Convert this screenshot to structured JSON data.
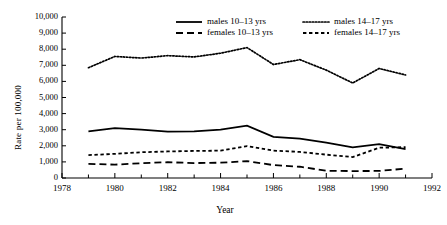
{
  "chart_data": {
    "type": "line",
    "title": "",
    "xlabel": "Year",
    "ylabel": "Rate per 100,000",
    "xlim": [
      1978,
      1992
    ],
    "ylim": [
      0,
      10000
    ],
    "grid": false,
    "legend_position": "top-inside",
    "x": [
      1979,
      1980,
      1981,
      1982,
      1983,
      1984,
      1985,
      1986,
      1987,
      1988,
      1989,
      1990,
      1991
    ],
    "xticks": [
      1978,
      1980,
      1982,
      1984,
      1986,
      1988,
      1990,
      1992
    ],
    "xtick_labels": [
      "1978",
      "1980",
      "1982",
      "1984",
      "1986",
      "1988",
      "1990",
      "1992"
    ],
    "xminor_ticks": [
      1979,
      1981,
      1983,
      1985,
      1987,
      1989,
      1991
    ],
    "yticks": [
      0,
      1000,
      2000,
      3000,
      4000,
      5000,
      6000,
      7000,
      8000,
      9000,
      10000
    ],
    "ytick_labels": [
      "0",
      "1,000",
      "2,000",
      "3,000",
      "4,000",
      "5,000",
      "6,000",
      "7,000",
      "8,000",
      "9,000",
      "10,000"
    ],
    "series": [
      {
        "name": "males 10–13 yrs",
        "style": "solid",
        "values": [
          2900,
          3100,
          3000,
          2880,
          2900,
          3000,
          3250,
          2550,
          2450,
          2200,
          1900,
          2100,
          1800
        ]
      },
      {
        "name": "males 14–17 yrs",
        "style": "dotted",
        "values": [
          6850,
          7550,
          7450,
          7600,
          7520,
          7750,
          8100,
          7050,
          7350,
          6700,
          5900,
          6800,
          6400
        ]
      },
      {
        "name": "females 10–13 yrs",
        "style": "long-dash",
        "values": [
          880,
          830,
          920,
          980,
          930,
          950,
          1050,
          800,
          700,
          450,
          430,
          440,
          580
        ]
      },
      {
        "name": "females 14–17 yrs",
        "style": "short-dash",
        "values": [
          1420,
          1500,
          1600,
          1650,
          1680,
          1700,
          1980,
          1700,
          1620,
          1450,
          1300,
          1880,
          1920
        ]
      }
    ]
  },
  "legend": {
    "entries": [
      {
        "label": "males 10–13 yrs",
        "style": "solid"
      },
      {
        "label": "males 14–17 yrs",
        "style": "dotted"
      },
      {
        "label": "females 10–13 yrs",
        "style": "long-dash"
      },
      {
        "label": "females 14–17 yrs",
        "style": "short-dash"
      }
    ]
  },
  "axes": {
    "y_title": "Rate per 100,000",
    "x_title": "Year"
  },
  "colors": {
    "line": "#000000",
    "axis": "#000000",
    "background": "#ffffff"
  }
}
